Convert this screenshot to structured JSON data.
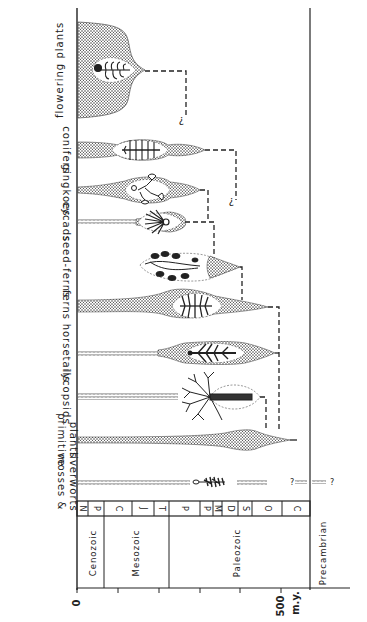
{
  "diagram": {
    "orientation": "rotated 90 degrees; time axis runs horizontally, lineages stacked vertically",
    "axis": {
      "tick_labels": [
        "0",
        "500"
      ],
      "unit": "m.y.",
      "ticks_my": [
        0,
        100,
        200,
        300,
        400,
        500
      ]
    },
    "eras": [
      {
        "name": "Cenozoic"
      },
      {
        "name": "Mesozoic"
      },
      {
        "name": "Paleozoic"
      },
      {
        "name": "Precambrian"
      }
    ],
    "periods": [
      "N",
      "P",
      "C",
      "J",
      "T",
      "P",
      "P",
      "M",
      "D",
      "S",
      "O",
      "C"
    ],
    "lineages": [
      {
        "id": "flowering",
        "label": "flowering plants"
      },
      {
        "id": "conifers",
        "label": "conifers"
      },
      {
        "id": "gingkoes",
        "label": "gingkoes"
      },
      {
        "id": "cycads",
        "label": "cycads"
      },
      {
        "id": "seedferns",
        "label": "seed-ferns"
      },
      {
        "id": "ferns",
        "label": "ferns"
      },
      {
        "id": "horsetails",
        "label": "horsetails"
      },
      {
        "id": "lycopsids",
        "label": "lycopsids"
      },
      {
        "id": "primitive",
        "label_line1": "primitive",
        "label_line2": "plants"
      },
      {
        "id": "mosses",
        "label_line1": "mosses &",
        "label_line2": "liverworts"
      }
    ],
    "uncertain_marker": "?",
    "colors": {
      "ink": "#222222",
      "stipple": "#555555",
      "background": "#ffffff"
    }
  }
}
